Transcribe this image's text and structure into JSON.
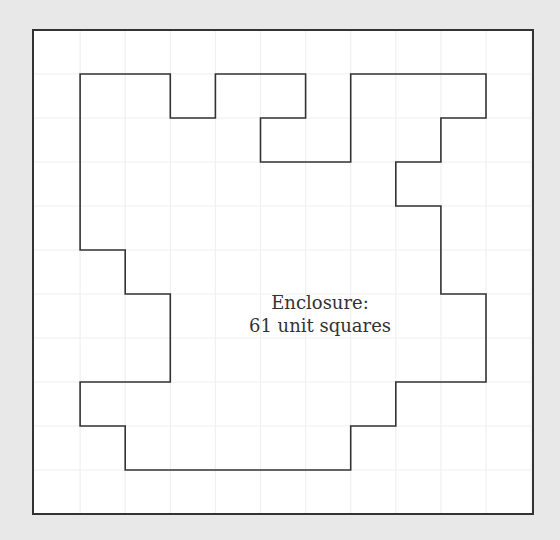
{
  "diagram": {
    "type": "grid-polygon",
    "grid": {
      "columns": 11,
      "rows": 11,
      "origin_px": [
        33,
        30
      ],
      "cell_w": 45.1,
      "cell_h": 44.0,
      "line_color": "#f0f0f0"
    },
    "frame": {
      "stroke": "#333333",
      "stroke_width": 2
    },
    "polygon": {
      "stroke": "#333333",
      "stroke_width": 1.6,
      "vertices_grid": [
        [
          1,
          1
        ],
        [
          3,
          1
        ],
        [
          3,
          2
        ],
        [
          4,
          2
        ],
        [
          4,
          1
        ],
        [
          6,
          1
        ],
        [
          6,
          2
        ],
        [
          5,
          2
        ],
        [
          5,
          3
        ],
        [
          7,
          3
        ],
        [
          7,
          1
        ],
        [
          10,
          1
        ],
        [
          10,
          2
        ],
        [
          9,
          2
        ],
        [
          9,
          3
        ],
        [
          8,
          3
        ],
        [
          8,
          4
        ],
        [
          9,
          4
        ],
        [
          9,
          6
        ],
        [
          10,
          6
        ],
        [
          10,
          8
        ],
        [
          8,
          8
        ],
        [
          8,
          9
        ],
        [
          7,
          9
        ],
        [
          7,
          10
        ],
        [
          2,
          10
        ],
        [
          2,
          9
        ],
        [
          1,
          9
        ],
        [
          1,
          8
        ],
        [
          3,
          8
        ],
        [
          3,
          6
        ],
        [
          2,
          6
        ],
        [
          2,
          5
        ],
        [
          1,
          5
        ]
      ],
      "area_unit_squares": 61
    },
    "label": {
      "line1": "Enclosure:",
      "line2": "61 unit squares"
    }
  },
  "colors": {
    "background": "#e8e8e8",
    "canvas": "#ffffff",
    "stroke": "#333333",
    "text": "#333333"
  }
}
